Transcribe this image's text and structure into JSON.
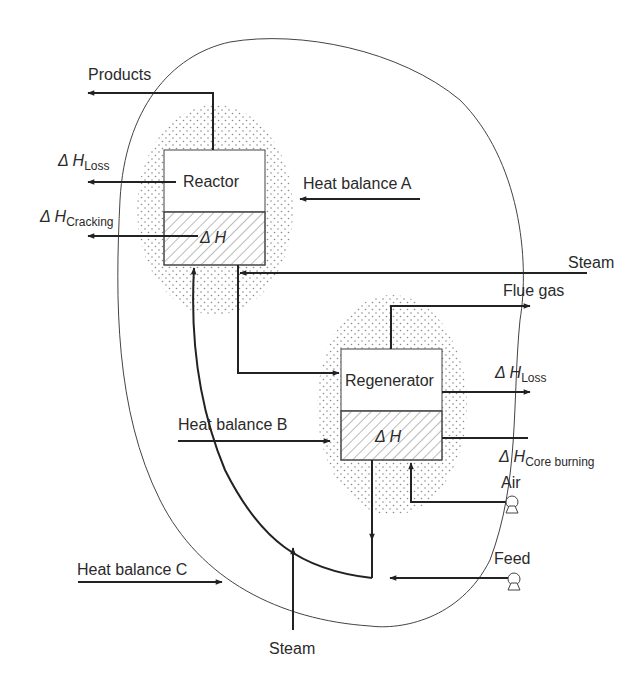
{
  "diagram": {
    "type": "process-flow",
    "units": {
      "reactor": {
        "label": "Reactor",
        "delta_h": "Δ H"
      },
      "regenerator": {
        "label": "Regenerator",
        "delta_h": "Δ H"
      }
    },
    "streams": {
      "products": "Products",
      "steam_top": "Steam",
      "flue_gas": "Flue gas",
      "air": "Air",
      "feed": "Feed",
      "steam_bottom": "Steam"
    },
    "heat_terms": {
      "reactor_loss": {
        "symbol": "Δ H",
        "subscript": "Loss"
      },
      "reactor_cracking": {
        "symbol": "Δ H",
        "subscript": "Cracking"
      },
      "regen_loss": {
        "symbol": "Δ H",
        "subscript": "Loss"
      },
      "regen_coke": {
        "symbol": "Δ H",
        "subscript": "Core burning"
      }
    },
    "balances": {
      "a": "Heat balance A",
      "b": "Heat balance B",
      "c": "Heat balance C"
    },
    "colors": {
      "line": "#222222",
      "text": "#2a2a2a",
      "stipple": "#8a8a8a",
      "hatch": "#777777"
    }
  }
}
